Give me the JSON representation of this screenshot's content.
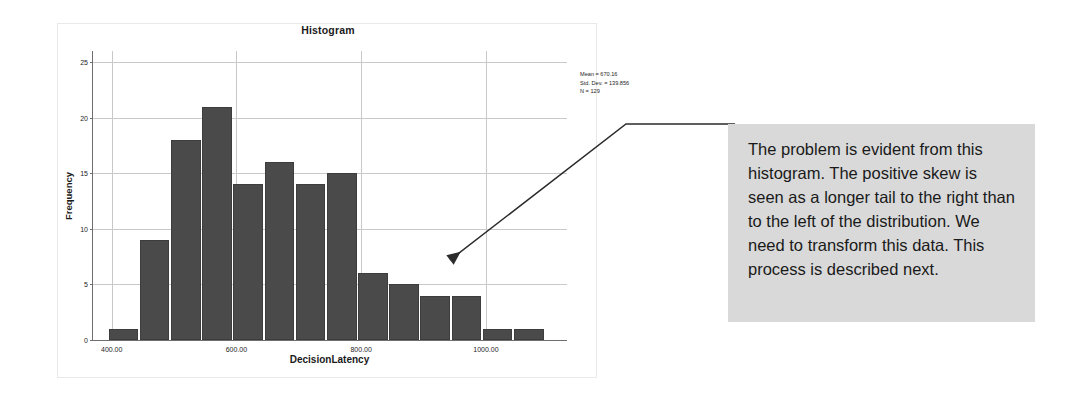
{
  "chart_data": {
    "type": "bar",
    "title": "Histogram",
    "xlabel": "DecisionLatency",
    "ylabel": "Frequency",
    "ylim": [
      0,
      26
    ],
    "xlim": [
      370,
      1130
    ],
    "grid": true,
    "legend": "none",
    "bar_color": "#4a4a4a",
    "bin_width": 50,
    "bin_starts": [
      395,
      445,
      495,
      545,
      595,
      645,
      695,
      745,
      795,
      845,
      895,
      945,
      995,
      1045
    ],
    "categories": [
      "395-445",
      "445-495",
      "495-545",
      "545-595",
      "595-645",
      "645-695",
      "695-745",
      "745-795",
      "795-845",
      "845-895",
      "895-945",
      "945-995",
      "995-1045",
      "1045-1095"
    ],
    "values": [
      1,
      9,
      18,
      21,
      14,
      16,
      14,
      15,
      6,
      5,
      4,
      4,
      1,
      1
    ],
    "ytick_labels": [
      "0",
      "5",
      "10",
      "15",
      "20",
      "25"
    ],
    "ytick_values": [
      0,
      5,
      10,
      15,
      20,
      25
    ],
    "xtick_labels": [
      "400.00",
      "600.00",
      "800.00",
      "1000.00"
    ],
    "xtick_values": [
      400,
      600,
      800,
      1000
    ],
    "annotations": {
      "mean": "Mean = 670.16",
      "std_dev": "Std. Dev. = 139.856",
      "n": "N = 129"
    }
  },
  "callout": {
    "text": "The problem is evident from this histogram. The positive skew is seen as a longer tail to the right than to the left of the distribution. We need to transform this data. This process is described next.",
    "background_color": "#d9d9d9",
    "connector_color": "#2b2b2b"
  }
}
